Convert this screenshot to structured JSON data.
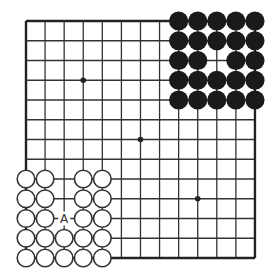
{
  "board": {
    "size": 13,
    "origin_px": [
      26,
      21
    ],
    "spacing_px": [
      19.08,
      19.75
    ],
    "stone_radius_px": 9.6,
    "line_color": "#333333",
    "edge_color": "#222222",
    "black_stone_color": "#1a1a1a",
    "white_stone_fill": "#ffffff",
    "white_stone_stroke": "#333333",
    "hoshi": [
      [
        3,
        3
      ],
      [
        6,
        6
      ],
      [
        9,
        9
      ]
    ]
  },
  "stones": {
    "black": [
      [
        8,
        0
      ],
      [
        9,
        0
      ],
      [
        10,
        0
      ],
      [
        11,
        0
      ],
      [
        12,
        0
      ],
      [
        8,
        1
      ],
      [
        9,
        1
      ],
      [
        10,
        1
      ],
      [
        11,
        1
      ],
      [
        12,
        1
      ],
      [
        8,
        2
      ],
      [
        9,
        2
      ],
      [
        11,
        2
      ],
      [
        12,
        2
      ],
      [
        8,
        3
      ],
      [
        9,
        3
      ],
      [
        10,
        3
      ],
      [
        11,
        3
      ],
      [
        12,
        3
      ],
      [
        8,
        4
      ],
      [
        9,
        4
      ],
      [
        10,
        4
      ],
      [
        11,
        4
      ],
      [
        12,
        4
      ]
    ],
    "white": [
      [
        0,
        8
      ],
      [
        1,
        8
      ],
      [
        3,
        8
      ],
      [
        4,
        8
      ],
      [
        0,
        9
      ],
      [
        1,
        9
      ],
      [
        3,
        9
      ],
      [
        4,
        9
      ],
      [
        0,
        10
      ],
      [
        1,
        10
      ],
      [
        3,
        10
      ],
      [
        4,
        10
      ],
      [
        0,
        11
      ],
      [
        1,
        11
      ],
      [
        2,
        11
      ],
      [
        3,
        11
      ],
      [
        4,
        11
      ],
      [
        0,
        12
      ],
      [
        1,
        12
      ],
      [
        2,
        12
      ],
      [
        3,
        12
      ],
      [
        4,
        12
      ]
    ]
  },
  "labels": [
    {
      "text": "A",
      "point": [
        2,
        10
      ]
    }
  ]
}
